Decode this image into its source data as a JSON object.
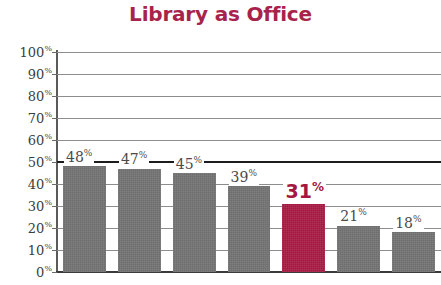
{
  "title": "Library as Office",
  "colors": {
    "title": "#a8234a",
    "bar_default": "#6e6e6e",
    "bar_highlight": "#a41740",
    "gridline": "#8d8d8d",
    "axis": "#3a3a3a",
    "label_text": "#4a4a4a"
  },
  "chart_data": {
    "type": "bar",
    "title": "Library as Office",
    "xlabel": "",
    "ylabel": "",
    "ylim": [
      0,
      100
    ],
    "grid": true,
    "legend": "none",
    "categories": [
      "",
      "",
      "",
      "",
      "",
      "",
      ""
    ],
    "values": [
      48,
      47,
      45,
      39,
      31,
      21,
      18
    ],
    "value_labels": [
      "48%",
      "47%",
      "45%",
      "39%",
      "31%",
      "21%",
      "18%"
    ],
    "highlight_index": 4,
    "y_ticks": [
      0,
      10,
      20,
      30,
      40,
      50,
      60,
      70,
      80,
      90,
      100
    ],
    "y_tick_labels": [
      "0%",
      "10%",
      "20%",
      "30%",
      "40%",
      "50%",
      "60%",
      "70%",
      "80%",
      "90%",
      "100%"
    ],
    "emphasis_gridline": 50
  }
}
